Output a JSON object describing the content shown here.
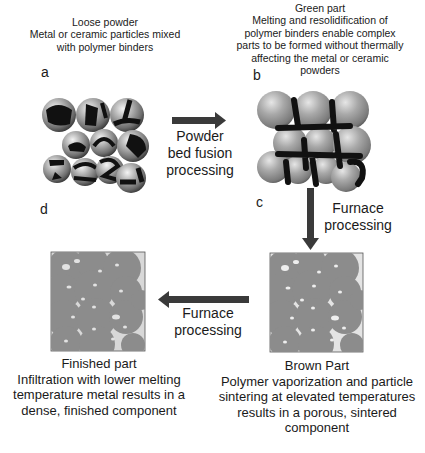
{
  "colors": {
    "particle_gray": "#9a9a9a",
    "binder_black": "#111111",
    "sintered_fill": "#8c8c8c",
    "box_background": "#d8d8d8",
    "pore_white": "#eeeeee",
    "arrow_color": "#3a3a3a"
  },
  "panels": {
    "a": {
      "letter": "a",
      "title": "Loose powder",
      "description": [
        "Metal or ceramic particles mixed",
        "with polymer binders"
      ]
    },
    "b": {
      "letter": "b",
      "title": "Green part",
      "description": [
        "Melting and resolidification of",
        "polymer binders enable complex",
        "parts to be formed without thermally",
        "affecting the metal or ceramic",
        "powders"
      ]
    },
    "c": {
      "letter": "c",
      "title": "Brown Part",
      "description": [
        "Polymer vaporization and particle",
        "sintering at elevated temperatures",
        "results in a porous, sintered",
        "component"
      ]
    },
    "d": {
      "letter": "d",
      "title": "Finished part",
      "description": [
        "Infiltration with lower melting",
        "temperature metal results in a",
        "dense, finished component"
      ]
    }
  },
  "arrows": {
    "a_to_b": {
      "direction": "right",
      "label": [
        "Powder",
        "bed fusion",
        "processing"
      ]
    },
    "b_to_c": {
      "direction": "down",
      "label": [
        "Furnace",
        "processing"
      ]
    },
    "c_to_d": {
      "direction": "left",
      "label": [
        "Furnace",
        "processing"
      ]
    }
  }
}
